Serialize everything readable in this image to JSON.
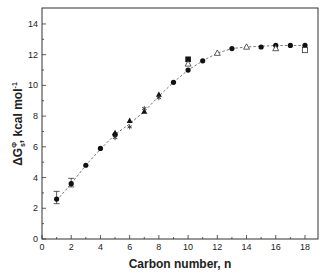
{
  "chart_data": {
    "type": "scatter",
    "title": "",
    "xlabel": "Carbon number, n",
    "ylabel": "ΔG°s , kcal mol⁻¹",
    "ylabel_parts": {
      "delta": "Δ",
      "G": "G",
      "sup": "Φ",
      "sub": "s",
      "units": ", kcal mol",
      "units_sup": "-1"
    },
    "xlim": [
      0,
      19
    ],
    "ylim": [
      0,
      15
    ],
    "xticks": [
      0,
      2,
      4,
      6,
      8,
      10,
      12,
      14,
      16,
      18
    ],
    "yticks": [
      0,
      2,
      4,
      6,
      8,
      10,
      12,
      14
    ],
    "grid": false,
    "legend": null,
    "fit_line": {
      "style": "dashed",
      "x": [
        1,
        2,
        3,
        4,
        5,
        6,
        7,
        8,
        9,
        10,
        11,
        12,
        13,
        14,
        15,
        16,
        17,
        18
      ],
      "y": [
        2.5,
        3.6,
        4.8,
        5.85,
        6.8,
        7.5,
        8.3,
        9.3,
        10.2,
        11.0,
        11.6,
        12.1,
        12.4,
        12.5,
        12.55,
        12.6,
        12.6,
        12.6
      ]
    },
    "series": [
      {
        "name": "filled circles",
        "marker": "filled-circle",
        "x": [
          1,
          2,
          3,
          4,
          5,
          9,
          10,
          11,
          13,
          15,
          16,
          17,
          18
        ],
        "y": [
          2.6,
          3.6,
          4.8,
          5.9,
          6.8,
          10.2,
          11.0,
          11.6,
          12.4,
          12.5,
          12.6,
          12.6,
          12.6
        ],
        "error": [
          0.5,
          0.35,
          0,
          0,
          0,
          0,
          0,
          0,
          0,
          0,
          0,
          0,
          0
        ]
      },
      {
        "name": "filled triangles",
        "marker": "filled-triangle",
        "x": [
          5,
          6,
          7,
          8
        ],
        "y": [
          6.9,
          7.7,
          8.3,
          9.4
        ]
      },
      {
        "name": "stars",
        "marker": "star",
        "x": [
          5,
          6,
          7,
          8
        ],
        "y": [
          6.6,
          7.3,
          8.5,
          9.2
        ]
      },
      {
        "name": "filled squares",
        "marker": "filled-square",
        "x": [
          10
        ],
        "y": [
          11.7
        ]
      },
      {
        "name": "open triangles",
        "marker": "open-triangle",
        "x": [
          10,
          12,
          14,
          16
        ],
        "y": [
          11.4,
          12.1,
          12.5,
          12.4
        ]
      },
      {
        "name": "open squares",
        "marker": "open-square",
        "x": [
          18
        ],
        "y": [
          12.3
        ]
      }
    ]
  }
}
